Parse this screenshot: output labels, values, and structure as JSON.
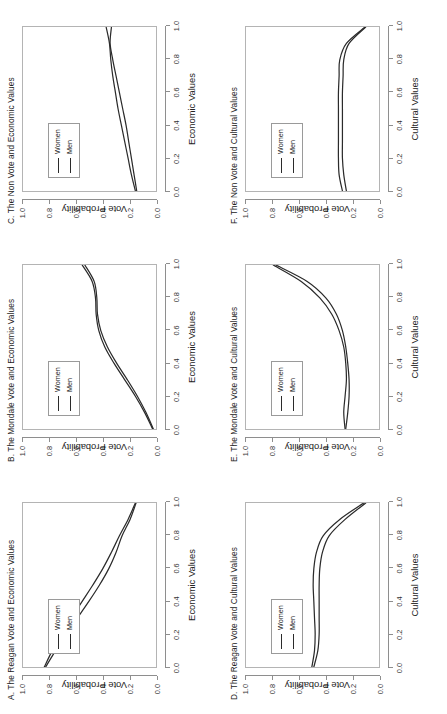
{
  "figure": {
    "background": "#ffffff",
    "line_color": "#2b2b2b",
    "axis_color": "#8e8e8e",
    "orientation": "rotated-90-ccw",
    "legend_labels": [
      "Women",
      "Men"
    ]
  },
  "axis": {
    "xticks": [
      "0.0",
      "0.2",
      "0.4",
      "0.6",
      "0.8",
      "1.0"
    ],
    "yticks": [
      "0.0",
      "0.2",
      "0.4",
      "0.6",
      "0.8",
      "1.0"
    ],
    "ylabel": "Vote Probability",
    "xlabel_economic": "Economic Values",
    "xlabel_cultural": "Cultural Values"
  },
  "chart_data": [
    {
      "id": "A",
      "type": "line",
      "title": "A. The Reagan Vote and Economic Values",
      "xlabel": "Economic Values",
      "ylabel": "Vote Probability",
      "xlim": [
        0.0,
        1.0
      ],
      "ylim": [
        0.0,
        1.0
      ],
      "grid": false,
      "legend": [
        "Women",
        "Men"
      ],
      "legend_position": "upper-left-inside",
      "x": [
        0.0,
        0.1,
        0.2,
        0.3,
        0.4,
        0.5,
        0.6,
        0.7,
        0.8,
        0.9,
        1.0
      ],
      "series": [
        {
          "name": "Women",
          "values": [
            0.84,
            0.78,
            0.71,
            0.635,
            0.555,
            0.475,
            0.4,
            0.335,
            0.275,
            0.21,
            0.155
          ]
        },
        {
          "name": "Men",
          "values": [
            0.83,
            0.755,
            0.675,
            0.59,
            0.505,
            0.425,
            0.355,
            0.3,
            0.255,
            0.195,
            0.15
          ]
        }
      ]
    },
    {
      "id": "B",
      "type": "line",
      "title": "B. The Mondale Vote and Economic Values",
      "xlabel": "Economic Values",
      "ylabel": "Vote Probability",
      "xlim": [
        0.0,
        1.0
      ],
      "ylim": [
        0.0,
        1.0
      ],
      "grid": false,
      "legend": [
        "Women",
        "Men"
      ],
      "legend_position": "upper-left-inside",
      "x": [
        0.0,
        0.1,
        0.2,
        0.3,
        0.4,
        0.5,
        0.6,
        0.7,
        0.8,
        0.9,
        1.0
      ],
      "series": [
        {
          "name": "Women",
          "values": [
            0.025,
            0.085,
            0.155,
            0.235,
            0.315,
            0.385,
            0.43,
            0.45,
            0.455,
            0.48,
            0.555
          ]
        },
        {
          "name": "Men",
          "values": [
            0.02,
            0.075,
            0.14,
            0.215,
            0.295,
            0.365,
            0.415,
            0.44,
            0.445,
            0.465,
            0.535
          ]
        }
      ]
    },
    {
      "id": "C",
      "type": "line",
      "title": "C. The Non Vote and Economic Values",
      "xlabel": "Economic Values",
      "ylabel": "Vote Probability",
      "xlim": [
        0.0,
        1.0
      ],
      "ylim": [
        0.0,
        1.0
      ],
      "grid": false,
      "legend": [
        "Women",
        "Men"
      ],
      "legend_position": "upper-left-inside",
      "x": [
        0.0,
        0.1,
        0.2,
        0.3,
        0.4,
        0.5,
        0.6,
        0.7,
        0.8,
        0.9,
        1.0
      ],
      "series": [
        {
          "name": "Women",
          "values": [
            0.145,
            0.165,
            0.185,
            0.205,
            0.225,
            0.25,
            0.275,
            0.3,
            0.325,
            0.345,
            0.335
          ]
        },
        {
          "name": "Men",
          "values": [
            0.155,
            0.185,
            0.21,
            0.235,
            0.26,
            0.285,
            0.305,
            0.325,
            0.34,
            0.35,
            0.375
          ]
        }
      ]
    },
    {
      "id": "D",
      "type": "line",
      "title": "D. The Reagan Vote and Cultural Values",
      "xlabel": "Cultural Values",
      "ylabel": "Vote Probability",
      "xlim": [
        0.0,
        1.0
      ],
      "ylim": [
        0.0,
        1.0
      ],
      "grid": false,
      "legend": [
        "Women",
        "Men"
      ],
      "legend_position": "upper-left-inside",
      "x": [
        0.0,
        0.1,
        0.2,
        0.3,
        0.4,
        0.5,
        0.6,
        0.7,
        0.8,
        0.9,
        1.0
      ],
      "series": [
        {
          "name": "Women",
          "values": [
            0.505,
            0.485,
            0.48,
            0.485,
            0.49,
            0.495,
            0.49,
            0.47,
            0.42,
            0.295,
            0.115
          ]
        },
        {
          "name": "Men",
          "values": [
            0.49,
            0.46,
            0.45,
            0.45,
            0.45,
            0.45,
            0.445,
            0.425,
            0.375,
            0.255,
            0.1
          ]
        }
      ]
    },
    {
      "id": "E",
      "type": "line",
      "title": "E. The Mondale Vote and Cultural Values",
      "xlabel": "Cultural Values",
      "ylabel": "Vote Probability",
      "xlim": [
        0.0,
        1.0
      ],
      "ylim": [
        0.0,
        1.0
      ],
      "grid": false,
      "legend": [
        "Women",
        "Men"
      ],
      "legend_position": "upper-left-inside",
      "x": [
        0.0,
        0.1,
        0.2,
        0.3,
        0.4,
        0.5,
        0.6,
        0.7,
        0.8,
        0.9,
        1.0
      ],
      "series": [
        {
          "name": "Women",
          "values": [
            0.255,
            0.265,
            0.255,
            0.245,
            0.25,
            0.265,
            0.3,
            0.355,
            0.445,
            0.585,
            0.795
          ]
        },
        {
          "name": "Men",
          "values": [
            0.25,
            0.235,
            0.225,
            0.225,
            0.235,
            0.25,
            0.275,
            0.32,
            0.4,
            0.54,
            0.775
          ]
        }
      ]
    },
    {
      "id": "F",
      "type": "line",
      "title": "F. The Non Vote and Cultural Values",
      "xlabel": "Cultural Values",
      "ylabel": "Vote Probability",
      "xlim": [
        0.0,
        1.0
      ],
      "ylim": [
        0.0,
        1.0
      ],
      "grid": false,
      "legend": [
        "Women",
        "Men"
      ],
      "legend_position": "upper-left-inside",
      "x": [
        0.0,
        0.1,
        0.2,
        0.3,
        0.4,
        0.5,
        0.6,
        0.7,
        0.8,
        0.9,
        1.0
      ],
      "series": [
        {
          "name": "Women",
          "values": [
            0.275,
            0.3,
            0.305,
            0.305,
            0.305,
            0.305,
            0.305,
            0.3,
            0.295,
            0.245,
            0.105
          ]
        },
        {
          "name": "Men",
          "values": [
            0.245,
            0.265,
            0.275,
            0.275,
            0.275,
            0.275,
            0.275,
            0.27,
            0.265,
            0.225,
            0.1
          ]
        }
      ]
    }
  ]
}
